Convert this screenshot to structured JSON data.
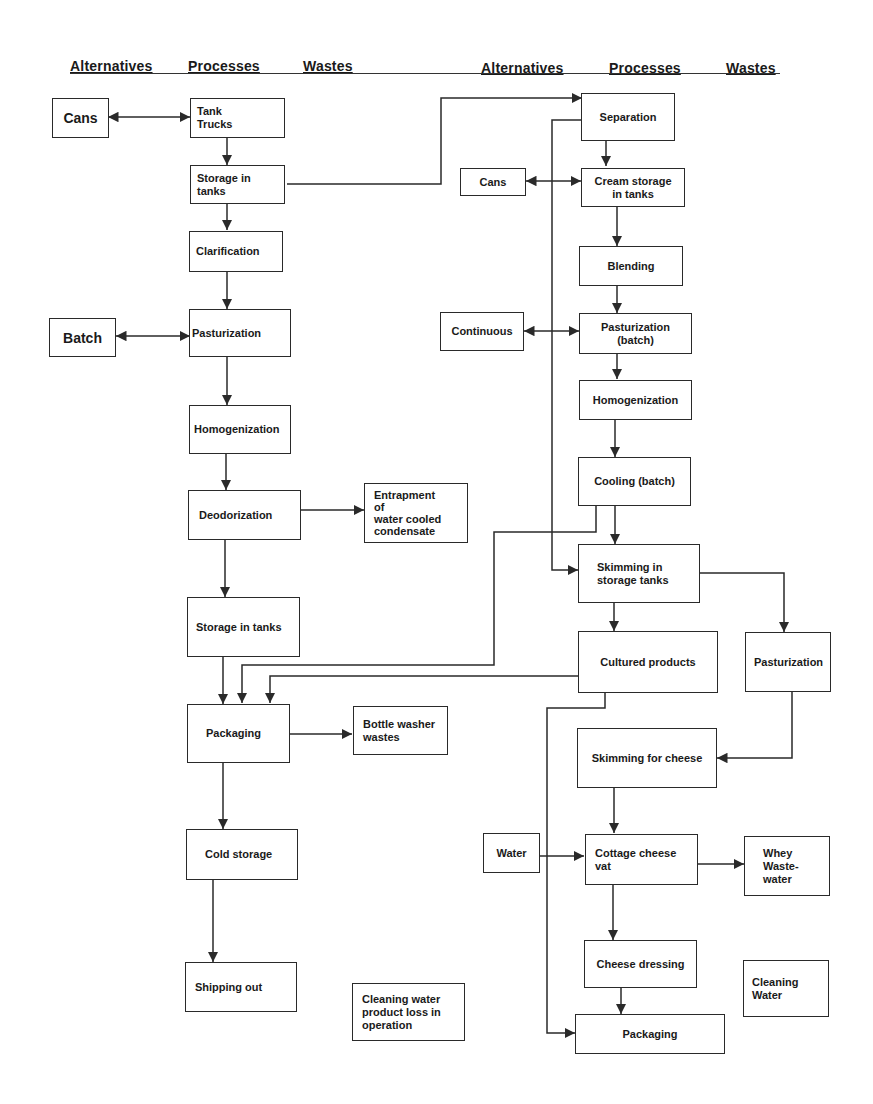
{
  "headers": {
    "left": [
      "Alternatives",
      "Processes",
      "Wastes"
    ],
    "right": [
      "Alternatives",
      "Processes",
      "Wastes"
    ]
  },
  "left_column": {
    "alternatives": [
      {
        "id": "cans",
        "label": "Cans"
      },
      {
        "id": "batch",
        "label": "Batch"
      }
    ],
    "processes": [
      {
        "id": "tank-trucks",
        "label": "Tank\nTrucks"
      },
      {
        "id": "storage-in-tanks-1",
        "label": "Storage in\ntanks"
      },
      {
        "id": "clarification",
        "label": "Clarification"
      },
      {
        "id": "pasturization",
        "label": "Pasturization"
      },
      {
        "id": "homogenization",
        "label": "Homogenization"
      },
      {
        "id": "deodorization",
        "label": "Deodorization"
      },
      {
        "id": "storage-in-tanks-2",
        "label": "Storage in tanks"
      },
      {
        "id": "packaging",
        "label": "Packaging"
      },
      {
        "id": "cold-storage",
        "label": "Cold storage"
      },
      {
        "id": "shipping-out",
        "label": "Shipping out"
      }
    ],
    "wastes": [
      {
        "id": "entrapment",
        "label": "Entrapment\nof\nwater cooled\ncondensate"
      },
      {
        "id": "bottle-washer",
        "label": "Bottle washer\nwastes"
      },
      {
        "id": "cleaning-water-loss",
        "label": "Cleaning water\n product loss in\noperation"
      }
    ]
  },
  "right_column": {
    "alternatives": [
      {
        "id": "cans-r",
        "label": "Cans"
      },
      {
        "id": "continuous",
        "label": "Continuous"
      },
      {
        "id": "water",
        "label": "Water"
      }
    ],
    "processes": [
      {
        "id": "separation",
        "label": "Separation"
      },
      {
        "id": "cream-storage",
        "label": "Cream storage\nin tanks"
      },
      {
        "id": "blending",
        "label": "Blending"
      },
      {
        "id": "pasturization-batch",
        "label": "Pasturization\n(batch)"
      },
      {
        "id": "homogenization-r",
        "label": "Homogenization"
      },
      {
        "id": "cooling-batch",
        "label": "Cooling (batch)"
      },
      {
        "id": "skimming-storage",
        "label": "Skimming in\nstorage tanks"
      },
      {
        "id": "cultured-products",
        "label": "Cultured products"
      },
      {
        "id": "pasturization-r",
        "label": "Pasturization"
      },
      {
        "id": "skimming-cheese",
        "label": "Skimming for cheese"
      },
      {
        "id": "cottage-cheese-vat",
        "label": "Cottage cheese\nvat"
      },
      {
        "id": "cheese-dressing",
        "label": "Cheese dressing"
      },
      {
        "id": "packaging-r",
        "label": "Packaging"
      }
    ],
    "wastes": [
      {
        "id": "whey-wastewater",
        "label": "Whey\nWaste-\nwater"
      },
      {
        "id": "cleaning-water",
        "label": "Cleaning\nWater"
      }
    ]
  },
  "colors": {
    "line": "#2a2a2a",
    "background": "#ffffff"
  }
}
